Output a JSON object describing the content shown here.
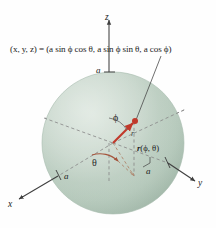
{
  "figure": {
    "background_color": "#fefefe",
    "sphere": {
      "label": "sphere-of-radius-a",
      "fill_light": "#cfdcd2",
      "fill_mid": "#b9cbbe",
      "fill_dark": "#9bb2a2",
      "center_x": 113,
      "center_y": 143,
      "radius": 71
    },
    "formula": {
      "text": "(x, y, z) = (a sin ϕ cos θ, a sin ϕ sin θ, a cos ϕ)"
    },
    "axes": [
      {
        "name": "z",
        "label": "z",
        "direction": "up"
      },
      {
        "name": "x",
        "label": "x",
        "direction": "lower-left"
      },
      {
        "name": "y",
        "label": "y",
        "direction": "lower-right"
      }
    ],
    "radius_marks": [
      {
        "name": "a-on-z-axis",
        "label": "a"
      },
      {
        "name": "a-on-x-axis",
        "label": "a"
      },
      {
        "name": "a-on-y-axis",
        "label": "a"
      }
    ],
    "angles": [
      {
        "name": "phi",
        "label": "ϕ",
        "description": "angle from positive z-axis"
      },
      {
        "name": "theta",
        "label": "θ",
        "description": "angle in xy-plane from positive x-axis"
      }
    ],
    "vector": {
      "name": "position-vector",
      "label_r": "r",
      "label_full_bold": "r",
      "label_full_args": "(ϕ, θ)",
      "color": "#c0392b",
      "point_color": "#c0392b"
    },
    "colors": {
      "sphere_green": "#bccfc2",
      "vector_red": "#c0392b",
      "arc_red": "#a4543c",
      "axis_gray": "#4a4a4a",
      "dash_gray": "#8b8b8b",
      "text_black": "#1c1c1c"
    }
  }
}
